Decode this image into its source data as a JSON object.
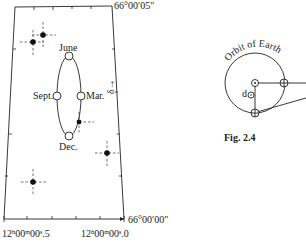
{
  "figure": {
    "caption": "Fig. 2.4",
    "main_chart": {
      "axis_labels": {
        "top_right_dec": "66°00′05″",
        "bottom_right_dec": "66°00′00″",
        "bottom_left_ra": "12ʰ00ᵐ00ˢ.5",
        "bottom_right_ra": "12ʰ00ᵐ00ˢ.0",
        "dec_arrow": "δ→"
      },
      "ellipse_labels": {
        "top": "June",
        "left": "Sept.",
        "right": "Mar.",
        "bottom": "Dec."
      },
      "stars": [
        {
          "x": 43,
          "y": 35
        },
        {
          "x": 33,
          "y": 42
        },
        {
          "x": 79,
          "y": 122
        },
        {
          "x": 107,
          "y": 153
        },
        {
          "x": 33,
          "y": 182
        }
      ]
    },
    "orbit_diagram": {
      "title": "Orbit of Earth",
      "distance_label": "d"
    }
  }
}
